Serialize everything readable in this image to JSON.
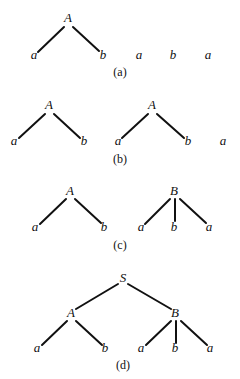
{
  "figure": {
    "panels": [
      {
        "id": "a",
        "caption": "(a)",
        "caption_pos": [
          120,
          76
        ],
        "nodes": [
          {
            "id": "A1",
            "label": "A",
            "x": 68,
            "y": 22
          },
          {
            "id": "l1",
            "label": "a",
            "x": 34,
            "y": 59
          },
          {
            "id": "l2",
            "label": "b",
            "x": 103,
            "y": 59
          },
          {
            "id": "l3",
            "label": "a",
            "x": 139,
            "y": 59
          },
          {
            "id": "l4",
            "label": "b",
            "x": 173,
            "y": 59
          },
          {
            "id": "l5",
            "label": "a",
            "x": 208,
            "y": 59
          }
        ],
        "edges": [
          {
            "from": [
              64,
              27
            ],
            "to": [
              38,
              52
            ]
          },
          {
            "from": [
              73,
              27
            ],
            "to": [
              99,
              51
            ]
          }
        ]
      },
      {
        "id": "b",
        "caption": "(b)",
        "caption_pos": [
          120,
          163
        ],
        "nodes": [
          {
            "id": "A1",
            "label": "A",
            "x": 49,
            "y": 109
          },
          {
            "id": "l1",
            "label": "a",
            "x": 14,
            "y": 145
          },
          {
            "id": "l2",
            "label": "b",
            "x": 84,
            "y": 145
          },
          {
            "id": "A2",
            "label": "A",
            "x": 152,
            "y": 109
          },
          {
            "id": "l3",
            "label": "a",
            "x": 118,
            "y": 145
          },
          {
            "id": "l4",
            "label": "b",
            "x": 188,
            "y": 145
          },
          {
            "id": "l5",
            "label": "a",
            "x": 223,
            "y": 145
          }
        ],
        "edges": [
          {
            "from": [
              45,
              114
            ],
            "to": [
              19,
              138
            ]
          },
          {
            "from": [
              54,
              114
            ],
            "to": [
              80,
              138
            ]
          },
          {
            "from": [
              148,
              114
            ],
            "to": [
              122,
              138
            ]
          },
          {
            "from": [
              157,
              114
            ],
            "to": [
              184,
              138
            ]
          }
        ]
      },
      {
        "id": "c",
        "caption": "(c)",
        "caption_pos": [
          120,
          249
        ],
        "nodes": [
          {
            "id": "A1",
            "label": "A",
            "x": 70,
            "y": 195
          },
          {
            "id": "l1",
            "label": "a",
            "x": 35,
            "y": 231
          },
          {
            "id": "l2",
            "label": "b",
            "x": 104,
            "y": 231
          },
          {
            "id": "B1",
            "label": "B",
            "x": 174,
            "y": 195
          },
          {
            "id": "l3",
            "label": "a",
            "x": 141,
            "y": 231
          },
          {
            "id": "l4",
            "label": "b",
            "x": 174,
            "y": 231
          },
          {
            "id": "l5",
            "label": "a",
            "x": 209,
            "y": 231
          }
        ],
        "edges": [
          {
            "from": [
              66,
              199
            ],
            "to": [
              40,
              224
            ]
          },
          {
            "from": [
              75,
              199
            ],
            "to": [
              101,
              223
            ]
          },
          {
            "from": [
              170,
              199
            ],
            "to": [
              145,
              224
            ]
          },
          {
            "from": [
              175,
              199
            ],
            "to": [
              175,
              221
            ]
          },
          {
            "from": [
              180,
              199
            ],
            "to": [
              206,
              223
            ]
          }
        ]
      },
      {
        "id": "d",
        "caption": "(d)",
        "caption_pos": [
          123,
          369
        ],
        "nodes": [
          {
            "id": "S",
            "label": "S",
            "x": 123,
            "y": 282
          },
          {
            "id": "A1",
            "label": "A",
            "x": 71,
            "y": 317
          },
          {
            "id": "B1",
            "label": "B",
            "x": 175,
            "y": 317
          },
          {
            "id": "l1",
            "label": "a",
            "x": 37,
            "y": 352
          },
          {
            "id": "l2",
            "label": "b",
            "x": 105,
            "y": 352
          },
          {
            "id": "l3",
            "label": "a",
            "x": 141,
            "y": 352
          },
          {
            "id": "l4",
            "label": "b",
            "x": 175,
            "y": 352
          },
          {
            "id": "l5",
            "label": "a",
            "x": 210,
            "y": 352
          }
        ],
        "edges": [
          {
            "from": [
              118,
              284
            ],
            "to": [
              76,
              309
            ]
          },
          {
            "from": [
              128,
              284
            ],
            "to": [
              171,
              309
            ]
          },
          {
            "from": [
              67,
              321
            ],
            "to": [
              42,
              345
            ]
          },
          {
            "from": [
              76,
              321
            ],
            "to": [
              102,
              345
            ]
          },
          {
            "from": [
              171,
              321
            ],
            "to": [
              146,
              345
            ]
          },
          {
            "from": [
              176,
              321
            ],
            "to": [
              176,
              343
            ]
          },
          {
            "from": [
              181,
              321
            ],
            "to": [
              207,
              345
            ]
          }
        ]
      }
    ]
  }
}
